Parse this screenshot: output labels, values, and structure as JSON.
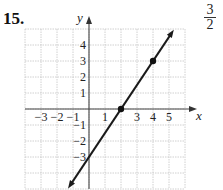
{
  "problem": {
    "number": "15.",
    "side_fraction": {
      "numerator": "3",
      "denominator": "2"
    }
  },
  "chart_data": {
    "type": "line",
    "title": "",
    "xlabel": "x",
    "ylabel": "y",
    "xlim": [
      -4,
      6
    ],
    "ylim": [
      -5,
      5
    ],
    "grid": true,
    "x_tick_labels": [
      "−3",
      "−2",
      "−1",
      "1",
      "3",
      "4",
      "5"
    ],
    "x_ticks": [
      -3,
      -2,
      -1,
      1,
      3,
      4,
      5
    ],
    "y_tick_labels": [
      "4",
      "3",
      "2",
      "1",
      "−1",
      "−2",
      "−3"
    ],
    "y_ticks": [
      4,
      3,
      2,
      1,
      -1,
      -2,
      -3
    ],
    "series": [
      {
        "name": "y = (3/2)x − 3",
        "equation": "y = 1.5x - 3",
        "slope": 1.5,
        "intercept": -3,
        "x_range": [
          -1.31,
          5.3
        ],
        "arrows": "both",
        "color": "#1a1a1a"
      }
    ],
    "points": [
      {
        "x": 2,
        "y": 0,
        "marked": true
      },
      {
        "x": 4,
        "y": 3,
        "marked": true
      }
    ],
    "y_intercept_label": "−3"
  }
}
